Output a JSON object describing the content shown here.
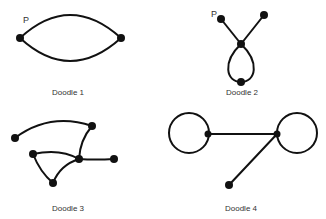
{
  "figure": {
    "stroke_color": "#111111",
    "text_color": "#333333",
    "doodles": [
      {
        "label": "Doodle 1",
        "point_label": "P"
      },
      {
        "label": "Doodle 2",
        "point_label": "P"
      },
      {
        "label": "Doodle 3"
      },
      {
        "label": "Doodle 4"
      }
    ]
  }
}
